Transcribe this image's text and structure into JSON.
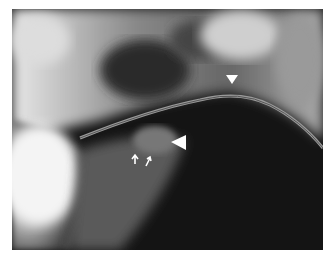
{
  "image": {
    "type": "lateral-neck-radiograph",
    "description": "Lateral radiograph of the neck showing a curved tube and annotation markers",
    "background_color": "#ffffff"
  },
  "annotations": [
    {
      "kind": "arrowhead",
      "direction": "down",
      "x": 232,
      "y": 78,
      "size": "small"
    },
    {
      "kind": "arrowhead",
      "direction": "left",
      "x": 178,
      "y": 142,
      "size": "large"
    },
    {
      "kind": "arrow",
      "direction": "up",
      "x": 135,
      "y": 158
    },
    {
      "kind": "arrow",
      "direction": "up-right",
      "x": 148,
      "y": 160
    }
  ]
}
